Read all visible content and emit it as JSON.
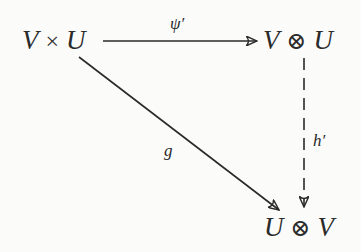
{
  "diagram": {
    "type": "commutative-diagram",
    "nodes": {
      "top_left": {
        "left": "V",
        "op": "×",
        "right": "U"
      },
      "top_right": {
        "left": "V",
        "op": "⊗",
        "right": "U"
      },
      "bottom_right": {
        "left": "U",
        "op": "⊗",
        "right": "V"
      }
    },
    "arrows": {
      "horizontal": {
        "from": "V × U",
        "to": "V ⊗ U",
        "label": "ψ′",
        "style": "solid"
      },
      "diagonal": {
        "from": "V × U",
        "to": "U ⊗ V",
        "label": "g",
        "style": "solid"
      },
      "vertical": {
        "from": "V ⊗ U",
        "to": "U ⊗ V",
        "label": "h′",
        "style": "dashed"
      }
    },
    "colors": {
      "ink": "#2a2a2a",
      "background": "#fbfbfa"
    }
  }
}
